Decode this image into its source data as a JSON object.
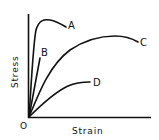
{
  "diagram": {
    "type": "stress-strain-curves",
    "axes": {
      "x_label": "Strain",
      "y_label": "Stress",
      "origin_label": "O"
    },
    "curves": [
      {
        "id": "A",
        "label": "A",
        "description": "steep rise, rounded peak, slight drop before fracture"
      },
      {
        "id": "B",
        "label": "B",
        "description": "steep straight line, brittle fracture"
      },
      {
        "id": "C",
        "label": "C",
        "description": "moderate rise, long ductile curve with broad maximum"
      },
      {
        "id": "D",
        "label": "D",
        "description": "low gentle rise, low stress"
      }
    ],
    "colors": {
      "line": "#111111",
      "background": "#ffffff"
    }
  }
}
